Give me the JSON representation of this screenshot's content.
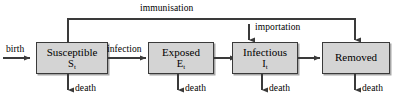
{
  "diagram": {
    "type": "flow-diagram",
    "colors": {
      "box_fill": "#d4d4d4",
      "box_border": "#3a3a3a",
      "line": "#3a3a3a",
      "text": "#000000",
      "background": "#ffffff"
    },
    "nodes": [
      {
        "id": "susceptible",
        "title": "Susceptible",
        "state": "S",
        "subscript": "t"
      },
      {
        "id": "exposed",
        "title": "Exposed",
        "state": "E",
        "subscript": "t"
      },
      {
        "id": "infectious",
        "title": "Infectious",
        "state": "I",
        "subscript": "t"
      },
      {
        "id": "removed",
        "title": "Removed",
        "state": "",
        "subscript": ""
      }
    ],
    "edges": [
      {
        "id": "birth",
        "label": "birth",
        "from": "external",
        "to": "susceptible",
        "direction": "right"
      },
      {
        "id": "infection",
        "label": "infection",
        "from": "susceptible",
        "to": "exposed",
        "direction": "right"
      },
      {
        "id": "progression",
        "label": "",
        "from": "exposed",
        "to": "infectious",
        "direction": "right"
      },
      {
        "id": "recovery",
        "label": "",
        "from": "infectious",
        "to": "removed",
        "direction": "right"
      },
      {
        "id": "immunisation",
        "label": "immunisation",
        "from": "susceptible",
        "to": "removed",
        "direction": "up-over-down"
      },
      {
        "id": "importation",
        "label": "importation",
        "from": "external",
        "to": "infectious",
        "direction": "down"
      },
      {
        "id": "death-s",
        "label": "death",
        "from": "susceptible",
        "to": "external",
        "direction": "down"
      },
      {
        "id": "death-e",
        "label": "death",
        "from": "exposed",
        "to": "external",
        "direction": "down"
      },
      {
        "id": "death-i",
        "label": "death",
        "from": "infectious",
        "to": "external",
        "direction": "down"
      },
      {
        "id": "death-r",
        "label": "death",
        "from": "removed",
        "to": "external",
        "direction": "down"
      }
    ]
  }
}
